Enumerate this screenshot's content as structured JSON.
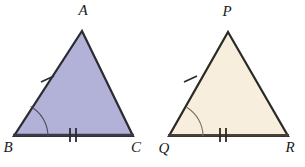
{
  "figure": {
    "background_color": "#ffffff",
    "canvas": {
      "width": 305,
      "height": 167
    }
  },
  "shapes": [
    {
      "id": "triangle-abc",
      "name": "triangle-abc",
      "fill_color": "#b2b2d8",
      "stroke_color": "#2b2b33",
      "stroke_width": 2.2,
      "points": "82,31 133,136 14,136",
      "vertices": [
        {
          "label": "A",
          "name": "vertex-label-a",
          "x": 82,
          "y": 31,
          "label_x": 83,
          "label_y": 15
        },
        {
          "label": "C",
          "name": "vertex-label-c",
          "x": 133,
          "y": 136,
          "label_x": 136,
          "label_y": 152
        },
        {
          "label": "B",
          "name": "vertex-label-b",
          "x": 14,
          "y": 136,
          "label_x": 8,
          "label_y": 152
        }
      ],
      "marks": {
        "single_tick": {
          "name": "single-tick-ab",
          "side": "AB",
          "x": 47,
          "y": 80
        },
        "double_tick": {
          "name": "double-tick-bc",
          "side": "BC",
          "x": 73,
          "y": 134
        },
        "angle_arc": {
          "name": "angle-arc-b",
          "vertex": "B",
          "x": 14,
          "y": 136,
          "radius": 34
        }
      }
    },
    {
      "id": "triangle-pqr",
      "name": "triangle-pqr",
      "fill_color": "#f7eede",
      "stroke_color": "#2b2b26",
      "stroke_width": 2.2,
      "points": "228,32 288,136 169,136",
      "vertices": [
        {
          "label": "P",
          "name": "vertex-label-p",
          "x": 228,
          "y": 32,
          "label_x": 227,
          "label_y": 16
        },
        {
          "label": "R",
          "name": "vertex-label-r",
          "x": 288,
          "y": 136,
          "label_x": 290,
          "label_y": 152
        },
        {
          "label": "Q",
          "name": "vertex-label-q",
          "x": 169,
          "y": 136,
          "label_x": 164,
          "label_y": 153
        }
      ],
      "marks": {
        "single_tick": {
          "name": "single-tick-pq",
          "side": "PQ",
          "x": 190,
          "y": 79
        },
        "double_tick": {
          "name": "double-tick-qr",
          "side": "QR",
          "x": 223,
          "y": 134
        },
        "angle_arc": {
          "name": "angle-arc-q",
          "vertex": "Q",
          "x": 169,
          "y": 136,
          "radius": 34
        }
      }
    }
  ]
}
